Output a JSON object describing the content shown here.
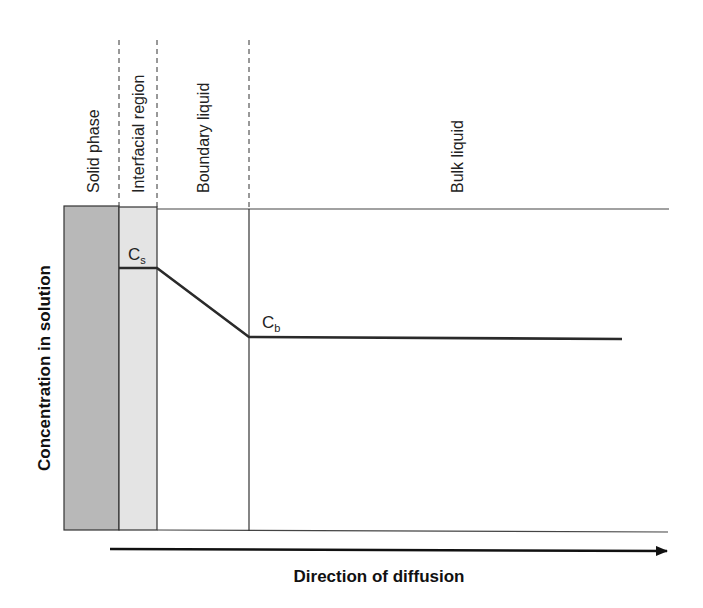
{
  "diagram": {
    "regions": [
      {
        "label": "Solid phase",
        "fill": "#b8b8b8"
      },
      {
        "label": "Interfacial region",
        "fill": "#e4e4e4"
      },
      {
        "label": "Boundary liquid",
        "fill": "#ffffff"
      },
      {
        "label": "Bulk liquid",
        "fill": "#ffffff"
      }
    ],
    "y_axis_label": "Concentration in solution",
    "x_axis_label": "Direction of diffusion",
    "points": {
      "surface": {
        "symbol": "C",
        "subscript": "s"
      },
      "bulk": {
        "symbol": "C",
        "subscript": "b"
      }
    },
    "line_color": "#2a2a2a"
  }
}
